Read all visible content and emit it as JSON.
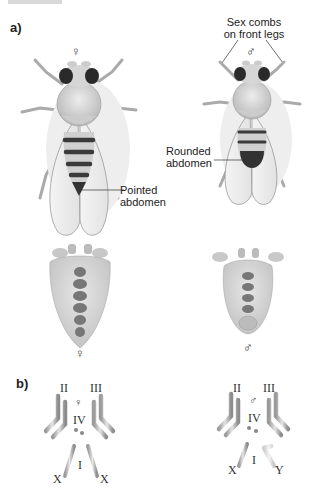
{
  "figure": {
    "panel_a": {
      "label": "a)",
      "female_symbol": "♀",
      "male_symbol": "♂",
      "callouts": {
        "sex_combs": [
          "Sex combs",
          "on front legs"
        ],
        "rounded_abdomen": [
          "Rounded",
          "abdomen"
        ],
        "pointed_abdomen": [
          "Pointed",
          "abdomen"
        ]
      },
      "female_ventral_symbol": "♀",
      "male_ventral_symbol": "♂"
    },
    "panel_b": {
      "label": "b)",
      "female": {
        "symbol": "♀",
        "chromosomes": [
          "II",
          "III",
          "IV",
          "I"
        ],
        "sex_chromosomes": [
          "X",
          "X"
        ]
      },
      "male": {
        "symbol": "♂",
        "chromosomes": [
          "II",
          "III",
          "IV",
          "I"
        ],
        "sex_chromosomes": [
          "X",
          "Y"
        ]
      }
    }
  }
}
